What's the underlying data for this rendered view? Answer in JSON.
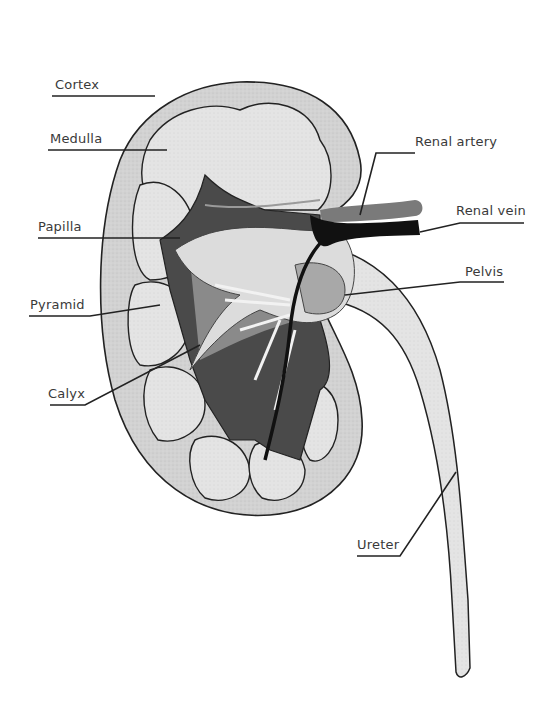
{
  "diagram": {
    "colors": {
      "cortex": "#d4d4d4",
      "pyramid": "#e6e6e6",
      "medulla_dark": "#4a4a4a",
      "medulla_mid": "#8a8a8a",
      "pelvis": "#dcdcdc",
      "pelvis_dark": "#a8a8a8",
      "artery": "#7a7a7a",
      "vein": "#111111",
      "ureter": "#e8e8e8",
      "outline": "#222222",
      "leader": "#222222"
    },
    "labels": [
      {
        "id": "cortex",
        "text": "Cortex"
      },
      {
        "id": "medulla",
        "text": "Medulla"
      },
      {
        "id": "papilla",
        "text": "Papilla"
      },
      {
        "id": "pyramid",
        "text": "Pyramid"
      },
      {
        "id": "calyx",
        "text": "Calyx"
      },
      {
        "id": "renal-artery",
        "text": "Renal artery"
      },
      {
        "id": "renal-vein",
        "text": "Renal vein"
      },
      {
        "id": "pelvis",
        "text": "Pelvis"
      },
      {
        "id": "ureter",
        "text": "Ureter"
      }
    ]
  }
}
